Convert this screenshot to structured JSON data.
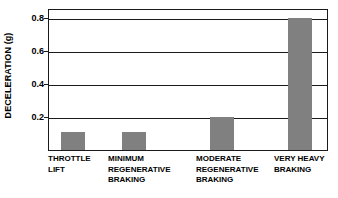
{
  "chart_data": {
    "type": "bar",
    "title": "",
    "xlabel": "",
    "ylabel": "DECELERATION (g)",
    "categories": [
      "THROTTLE\nLIFT",
      "MINIMUM\nREGENERATIVE\nBRAKING",
      "MODERATE\nREGENERATIVE\nBRAKING",
      "VERY HEAVY\nBRAKING"
    ],
    "values": [
      0.11,
      0.11,
      0.2,
      0.8
    ],
    "ylim": [
      0,
      0.86
    ],
    "yticks": [
      0.2,
      0.4,
      0.6,
      0.8
    ],
    "ytick_labels": [
      "0.2",
      "0.4",
      "0.6",
      "0.8"
    ],
    "grid": true,
    "legend": "none",
    "bar_color": "#808080",
    "axis_color": "#1a1a1a",
    "background_color": "#ffffff"
  }
}
